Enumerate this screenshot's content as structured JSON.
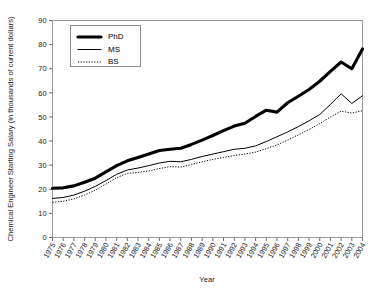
{
  "chart_data": {
    "type": "line",
    "title": "",
    "xlabel": "Year",
    "ylabel": "Chemical Engineer Starting Salary (in thousands of current dollars)",
    "ylim": [
      0,
      90
    ],
    "ytick_step": 10,
    "yticks": [
      0,
      10,
      20,
      30,
      40,
      50,
      60,
      70,
      80,
      90
    ],
    "grid": false,
    "legend_position": "top-left",
    "categories": [
      "1975",
      "1976",
      "1977",
      "1978",
      "1979",
      "1980",
      "1981",
      "1982",
      "1983",
      "1984",
      "1985",
      "1986",
      "1987",
      "1988",
      "1989",
      "1990",
      "1991",
      "1992",
      "1993",
      "1994",
      "1995",
      "1996",
      "1997",
      "1998",
      "1999",
      "2000",
      "2001",
      "2002",
      "2003",
      "2004"
    ],
    "series": [
      {
        "name": "PhD",
        "style": "thick-solid",
        "color": "#000000",
        "values": [
          20.4,
          20.6,
          21.4,
          22.9,
          24.6,
          27.2,
          29.8,
          31.8,
          33.2,
          34.6,
          36.1,
          36.6,
          37.0,
          38.6,
          40.4,
          42.3,
          44.3,
          46.2,
          47.4,
          50.2,
          52.8,
          52.0,
          55.9,
          58.6,
          61.4,
          64.8,
          68.9,
          72.8,
          70.0,
          78.2
        ]
      },
      {
        "name": "MS",
        "style": "thin-solid",
        "color": "#000000",
        "values": [
          16.2,
          16.6,
          17.6,
          19.2,
          21.2,
          23.6,
          26.2,
          28.0,
          28.8,
          29.8,
          30.9,
          31.6,
          31.4,
          32.4,
          33.6,
          34.6,
          35.6,
          36.6,
          37.0,
          38.0,
          39.8,
          41.8,
          43.8,
          46.0,
          48.4,
          51.0,
          55.2,
          59.6,
          55.6,
          58.8
        ]
      },
      {
        "name": "BS",
        "style": "dotted",
        "color": "#000000",
        "values": [
          14.6,
          15.0,
          16.0,
          17.6,
          19.6,
          22.2,
          24.8,
          26.6,
          27.0,
          27.6,
          28.6,
          29.4,
          29.2,
          30.2,
          31.4,
          32.4,
          33.2,
          34.0,
          34.6,
          35.4,
          36.8,
          38.4,
          40.4,
          42.6,
          44.8,
          47.2,
          50.0,
          52.4,
          51.6,
          52.6
        ]
      }
    ]
  },
  "legend": {
    "entries": [
      {
        "label": "PhD",
        "style": "thick-solid"
      },
      {
        "label": "MS",
        "style": "thin-solid"
      },
      {
        "label": "BS",
        "style": "dotted"
      }
    ]
  }
}
